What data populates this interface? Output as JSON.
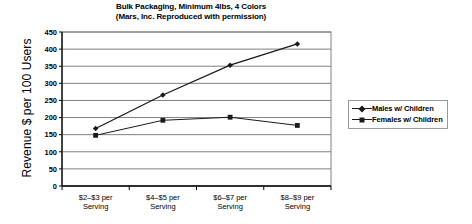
{
  "chart_data": {
    "type": "line",
    "title": "Bulk Packaging, Minimum 4lbs, 4 Colors",
    "subtitle": "(Mars, Inc. Reproduced with permission)",
    "xlabel": "",
    "ylabel": "Revenue $ per 100 Users",
    "categories": [
      "$2–$3 per Serving",
      "$4–$5 per Serving",
      "$6–$7 per Serving",
      "$8–$9 per Serving"
    ],
    "category_lines": [
      [
        "$2–$3 per",
        "Serving"
      ],
      [
        "$4–$5 per",
        "Serving"
      ],
      [
        "$6–$7 per",
        "Serving"
      ],
      [
        "$8–$9 per",
        "Serving"
      ]
    ],
    "series": [
      {
        "name": "Males w/ Children",
        "marker": "diamond",
        "color": "#1a1a1a",
        "values": [
          168,
          266,
          353,
          415
        ]
      },
      {
        "name": "Females w/ Children",
        "marker": "square",
        "color": "#1a1a1a",
        "values": [
          148,
          192,
          201,
          177
        ]
      }
    ],
    "ylim": [
      0,
      450
    ],
    "yticks": [
      0,
      50,
      100,
      150,
      200,
      250,
      300,
      350,
      400,
      450
    ],
    "ytick_labels": [
      "0",
      "50",
      "100",
      "150",
      "200",
      "250",
      "300",
      "350",
      "400",
      "450"
    ],
    "grid": "horizontal",
    "legend_position": "right"
  },
  "legend": {
    "entries": [
      {
        "label": "Males w/ Children",
        "marker": "diamond"
      },
      {
        "label": "Females w/ Children",
        "marker": "square"
      }
    ]
  }
}
